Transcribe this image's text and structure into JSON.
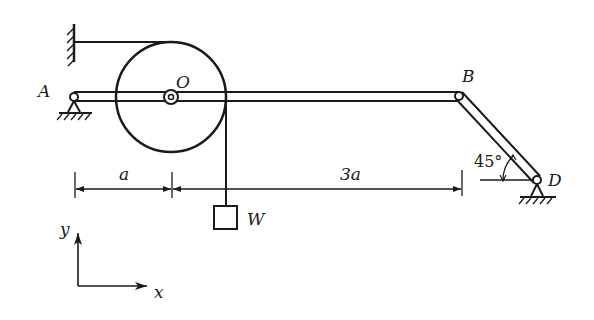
{
  "diagram": {
    "type": "statics-mechanism",
    "points": {
      "A": {
        "label": "A"
      },
      "O": {
        "label": "O"
      },
      "B": {
        "label": "B"
      },
      "D": {
        "label": "D"
      }
    },
    "weight": {
      "label": "W"
    },
    "dimensions": [
      {
        "label": "a",
        "from": "A",
        "to": "O"
      },
      {
        "label": "3a",
        "from": "O",
        "to": "B"
      }
    ],
    "angle": {
      "label": "45°",
      "at": "D"
    },
    "axes": {
      "x_label": "x",
      "y_label": "y"
    },
    "colors": {
      "stroke": "#1a1a1a",
      "background": "#ffffff"
    }
  }
}
